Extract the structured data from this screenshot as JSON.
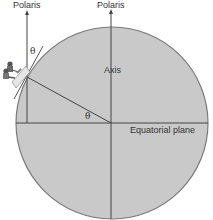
{
  "labels": {
    "polaris_left": "Polaris",
    "polaris_center": "Polaris",
    "axis": "Axis",
    "equatorial_plane": "Equatorial plane",
    "theta_observer": "θ",
    "theta_center": "θ"
  },
  "icons": {
    "observers": "people-on-bench-icon"
  },
  "colors": {
    "earth_fill": "#c9c9c9",
    "earth_stroke": "#7a7a7a",
    "line": "#444444",
    "text": "#333333",
    "background": "#ffffff"
  }
}
